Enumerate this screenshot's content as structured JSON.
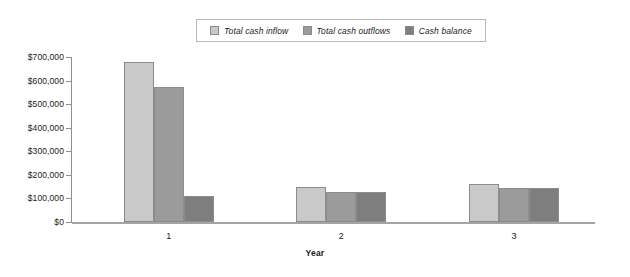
{
  "chart_data": {
    "type": "bar",
    "title": "",
    "xlabel": "Year",
    "ylabel": "",
    "categories": [
      "1",
      "2",
      "3"
    ],
    "series": [
      {
        "name": "Total cash inflow",
        "color": "#c9c9c9",
        "values": [
          680000,
          148000,
          160000
        ]
      },
      {
        "name": "Total cash outflows",
        "color": "#9b9b9b",
        "values": [
          572000,
          128000,
          143000
        ]
      },
      {
        "name": "Cash balance",
        "color": "#7e7e7e",
        "values": [
          112000,
          128000,
          143000
        ]
      }
    ],
    "ylim": [
      0,
      700000
    ],
    "ytick_values": [
      0,
      100000,
      200000,
      300000,
      400000,
      500000,
      600000,
      700000
    ],
    "ytick_labels": [
      "$0",
      "$100,000",
      "$200,000",
      "$300,000",
      "$400,000",
      "$500,000",
      "$600,000",
      "$700,000"
    ],
    "grid": false,
    "legend_position": "top-center",
    "legend_italic": true
  },
  "legend": {
    "entries": [
      {
        "label": "Total cash inflow"
      },
      {
        "label": "Total cash outflows"
      },
      {
        "label": "Cash balance"
      }
    ]
  },
  "axes": {
    "x_title": "Year",
    "x_labels": [
      "1",
      "2",
      "3"
    ],
    "y_labels": [
      "$700,000",
      "$600,000",
      "$500,000",
      "$400,000",
      "$300,000",
      "$200,000",
      "$100,000",
      "$0"
    ]
  }
}
